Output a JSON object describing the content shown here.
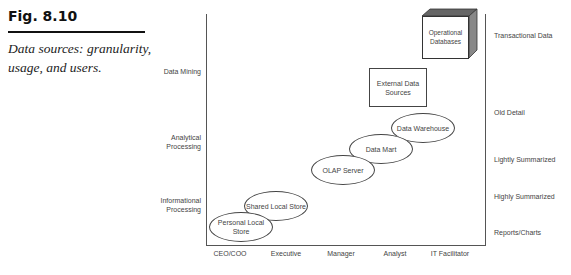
{
  "figure": {
    "number": "Fig. 8.10",
    "caption": "Data sources: granularity, usage, and users."
  },
  "diagram": {
    "y_axis_labels": [
      "Data Mining",
      "Analytical Processing",
      "Informational Processing"
    ],
    "x_axis_labels": [
      "CEO/COO",
      "Executive",
      "Manager",
      "Analyst",
      "IT Facilitator"
    ],
    "right_axis_labels": [
      "Transactional Data",
      "Old Detail",
      "Lightly Summarized",
      "Highly Summarized",
      "Reports/Charts"
    ],
    "nodes": {
      "operational_databases": "Operational Databases",
      "external_data_sources": "External Data Sources",
      "data_warehouse": "Data Warehouse",
      "data_mart": "Data Mart",
      "olap_server": "OLAP Server",
      "shared_local_store": "Shared Local Store",
      "personal_local_store": "Personal Local Store"
    }
  }
}
